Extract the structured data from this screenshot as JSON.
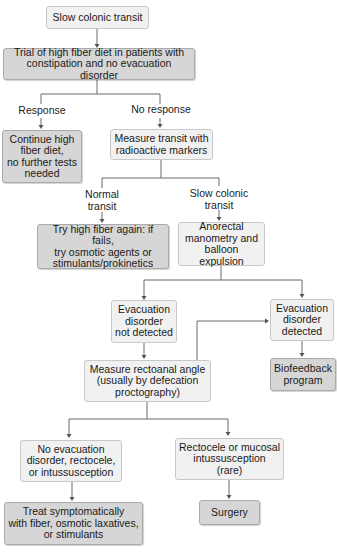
{
  "flowchart": {
    "nodes": {
      "start": "Slow colonic transit",
      "fiber_trial": "Trial of high fiber diet in patients with\nconstipation and no evacuation disorder",
      "continue_fiber": "Continue high\nfiber diet,\nno further tests\nneeded",
      "measure_transit": "Measure transit with\nradioactive markers",
      "try_fiber_again": "Try high fiber again: if fails,\ntry osmotic agents or\nstimulants/prokinetics",
      "anorectal": "Anorectal\nmanometry and\nballoon expulsion",
      "evac_not_detected": "Evacuation\ndisorder\nnot detected",
      "evac_detected": "Evacuation\ndisorder\ndetected",
      "rectoanal": "Measure rectoanal angle\n(usually by defecation\nproctography)",
      "biofeedback": "Biofeedback\nprogram",
      "no_evac": "No evacuation\ndisorder, rectocele,\nor intussusception",
      "rectocele": "Rectocele or mucosal\nintussusception\n(rare)",
      "treat": "Treat symptomatically\nwith fiber, osmotic laxatives,\nor stimulants",
      "surgery": "Surgery"
    },
    "edge_labels": {
      "response": "Response",
      "no_response": "No response",
      "normal_transit": "Normal\ntransit",
      "slow_transit": "Slow colonic\ntransit"
    },
    "colors": {
      "action_box": "#d6d6d6",
      "state_box": "#f1f1f1",
      "line": "#6a6a6a"
    }
  }
}
